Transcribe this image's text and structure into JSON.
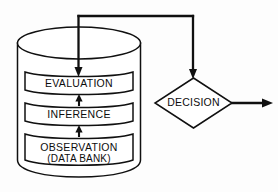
{
  "diagram": {
    "background_color": "#fdfdfd",
    "stroke_color": "#101010",
    "fill_color": "#ffffff",
    "cylinder": {
      "name": "data-bank-cylinder",
      "boxes": [
        {
          "id": "evaluation",
          "lines": [
            "EVALUATION"
          ]
        },
        {
          "id": "inference",
          "lines": [
            "INFERENCE"
          ]
        },
        {
          "id": "observation",
          "lines": [
            "OBSERVATION",
            "(DATA BANK)"
          ]
        }
      ]
    },
    "decision": {
      "name": "decision-diamond",
      "label": "DECISION"
    },
    "connectors": [
      {
        "id": "observation-to-inference",
        "kind": "arrow-up"
      },
      {
        "id": "inference-to-evaluation",
        "kind": "arrow-up"
      },
      {
        "id": "evaluation-feedback-to-decision",
        "kind": "elbow"
      },
      {
        "id": "decision-output",
        "kind": "arrow-right"
      }
    ]
  }
}
